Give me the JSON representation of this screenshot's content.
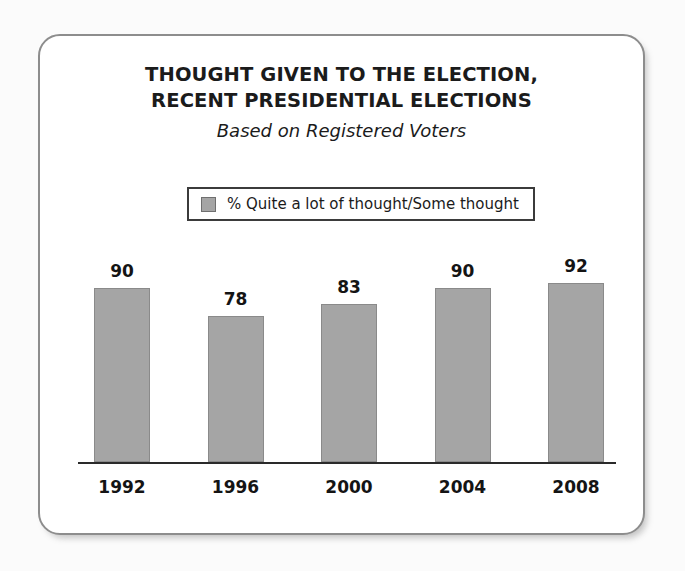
{
  "figure": {
    "title_lines": [
      "THOUGHT GIVEN TO THE ELECTION,",
      "RECENT PRESIDENTIAL ELECTIONS"
    ],
    "subtitle": "Based on Registered Voters"
  },
  "legend": {
    "label": "% Quite a lot of thought/Some thought",
    "swatch_color": "#a5a5a5"
  },
  "chart_data": {
    "type": "bar",
    "title": "THOUGHT GIVEN TO THE ELECTION, RECENT PRESIDENTIAL ELECTIONS",
    "subtitle": "Based on Registered Voters",
    "categories": [
      "1992",
      "1996",
      "2000",
      "2004",
      "2008"
    ],
    "values": [
      90,
      78,
      83,
      90,
      92
    ],
    "series": [
      {
        "name": "% Quite a lot of thought/Some thought",
        "values": [
          90,
          78,
          83,
          90,
          92
        ],
        "color": "#a5a5a5"
      }
    ],
    "value_labels": [
      "90",
      "78",
      "83",
      "90",
      "92"
    ],
    "xlabel": "",
    "ylabel": "",
    "ylim": [
      0,
      100
    ],
    "grid": false,
    "legend_position": "above-plot",
    "axis_visible": "x-only"
  }
}
